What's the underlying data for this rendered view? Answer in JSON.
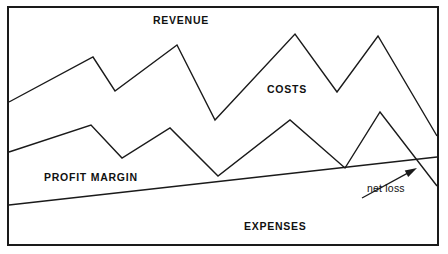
{
  "figure": {
    "type": "line-chart-illustration",
    "background_color": "#ffffff",
    "line_color": "#1a1a1a",
    "frame_color": "#1a1a1a",
    "width": 448,
    "height": 254
  },
  "labels": {
    "revenue": "REVENUE",
    "costs": "COSTS",
    "profit_margin": "PROFIT MARGIN",
    "expenses": "EXPENSES",
    "net_loss": "net loss"
  },
  "chart_data": {
    "type": "line",
    "title": "",
    "subtitle": "",
    "xlabel": "",
    "ylabel": "",
    "grid": false,
    "legend": false,
    "axis_ticks": false,
    "xlim": [
      0,
      448
    ],
    "ylim": [
      254,
      0
    ],
    "note": "Hand-drawn style business illustration; coordinates are pixel positions in the image (y increases downward). No numeric axes are printed on the figure.",
    "annotations": [
      {
        "text": "REVENUE",
        "x": 153,
        "y": 15,
        "style": "uppercase"
      },
      {
        "text": "COSTS",
        "x": 267,
        "y": 84,
        "style": "uppercase"
      },
      {
        "text": "PROFIT MARGIN",
        "x": 44,
        "y": 172,
        "style": "uppercase"
      },
      {
        "text": "EXPENSES",
        "x": 244,
        "y": 221,
        "style": "uppercase"
      },
      {
        "text": "net loss",
        "x": 367,
        "y": 183,
        "style": "lowercase",
        "has_arrow": true
      }
    ],
    "arrow": {
      "from": [
        362,
        198
      ],
      "to": [
        417,
        168
      ],
      "points_at": "crossing of revenue line and expenses line"
    },
    "series": [
      {
        "name": "revenue",
        "style": "zigzag",
        "points": [
          [
            9,
            102
          ],
          [
            93,
            57
          ],
          [
            115,
            91
          ],
          [
            177,
            45
          ],
          [
            215,
            120
          ],
          [
            295,
            34
          ],
          [
            337,
            92
          ],
          [
            378,
            36
          ],
          [
            437,
            136
          ]
        ]
      },
      {
        "name": "costs",
        "style": "zigzag",
        "points": [
          [
            9,
            152
          ],
          [
            91,
            125
          ],
          [
            122,
            158
          ],
          [
            170,
            128
          ],
          [
            218,
            176
          ],
          [
            290,
            120
          ],
          [
            345,
            168
          ],
          [
            380,
            112
          ],
          [
            437,
            186
          ]
        ]
      },
      {
        "name": "expenses",
        "style": "straight-rising",
        "points": [
          [
            9,
            205
          ],
          [
            437,
            157
          ]
        ]
      }
    ]
  }
}
